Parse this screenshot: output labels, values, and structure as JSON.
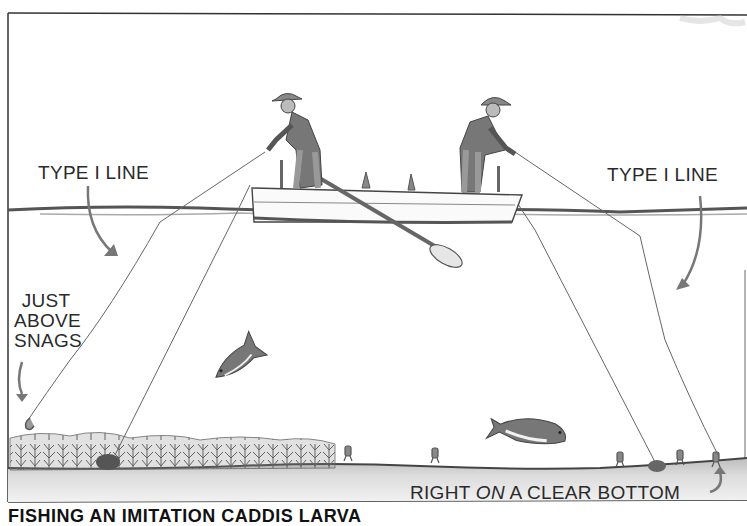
{
  "figure": {
    "labels": {
      "left_line": "TYPE I LINE",
      "right_line": "TYPE I LINE",
      "snags_1": "JUST",
      "snags_2": "ABOVE",
      "snags_3": "SNAGS",
      "bottom_pre": "RIGHT ",
      "bottom_em": "ON",
      "bottom_post": " A CLEAR BOTTOM"
    },
    "caption": "FISHING AN IMITATION CADDIS LARVA",
    "colors": {
      "ink": "#2a2a2a",
      "pencil": "#6b6b6b",
      "shade": "#9a9a9a",
      "paper": "#ffffff",
      "bottom_shade": "#d9d9d9"
    }
  }
}
